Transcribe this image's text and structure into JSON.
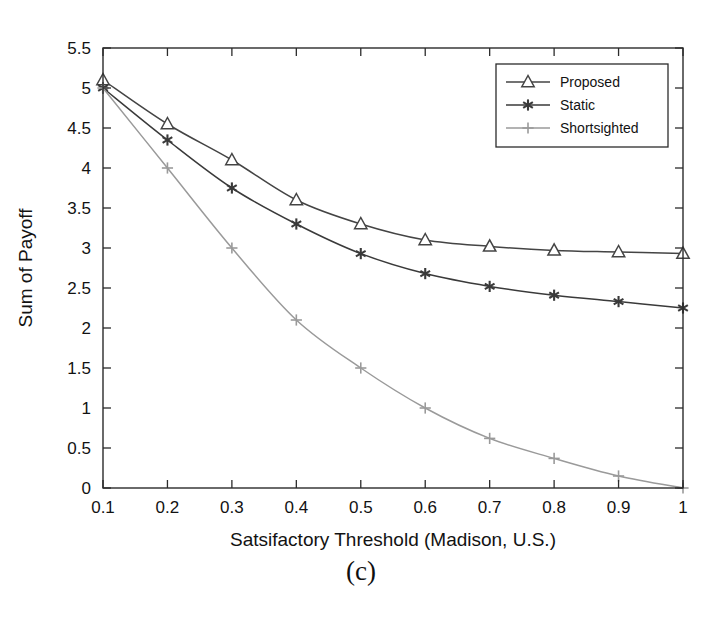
{
  "figure": {
    "caption": "(c)"
  },
  "chart_data": {
    "type": "line",
    "title": "",
    "xlabel": "Satsifactory Threshold (Madison, U.S.)",
    "ylabel": "Sum of Payoff",
    "x": [
      0.1,
      0.2,
      0.3,
      0.4,
      0.5,
      0.6,
      0.7,
      0.8,
      0.9,
      1.0
    ],
    "xlim": [
      0.1,
      1.0
    ],
    "ylim": [
      0,
      5.5
    ],
    "xticks": [
      0.1,
      0.2,
      0.3,
      0.4,
      0.5,
      0.6,
      0.7,
      0.8,
      0.9,
      1.0
    ],
    "xtick_labels": [
      "0.1",
      "0.2",
      "0.3",
      "0.4",
      "0.5",
      "0.6",
      "0.7",
      "0.8",
      "0.9",
      "1"
    ],
    "yticks": [
      0,
      0.5,
      1,
      1.5,
      2,
      2.5,
      3,
      3.5,
      4,
      4.5,
      5,
      5.5
    ],
    "ytick_labels": [
      "0",
      "0.5",
      "1",
      "1.5",
      "2",
      "2.5",
      "3",
      "3.5",
      "4",
      "4.5",
      "5",
      "5.5"
    ],
    "grid": false,
    "legend_position": "upper right",
    "series": [
      {
        "name": "Proposed",
        "marker": "triangle",
        "color": "#444444",
        "values": [
          5.1,
          4.55,
          4.1,
          3.6,
          3.3,
          3.1,
          3.02,
          2.97,
          2.95,
          2.93
        ]
      },
      {
        "name": "Static",
        "marker": "asterisk",
        "color": "#3a3a3a",
        "values": [
          5.0,
          4.35,
          3.75,
          3.3,
          2.93,
          2.68,
          2.52,
          2.41,
          2.33,
          2.25
        ]
      },
      {
        "name": "Shortsighted",
        "marker": "plus",
        "color": "#9a9a9a",
        "values": [
          5.0,
          4.0,
          3.0,
          2.1,
          1.5,
          1.0,
          0.62,
          0.37,
          0.15,
          0.0
        ]
      }
    ]
  },
  "colors": {
    "axis": "#2b2b2b",
    "background": "#ffffff",
    "text": "#121212"
  }
}
